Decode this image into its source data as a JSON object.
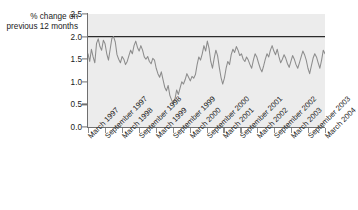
{
  "chart_data": {
    "type": "line",
    "title": "",
    "xlabel": "",
    "ylabel": "% change on previous 12 months",
    "ylim": [
      0.0,
      2.5
    ],
    "ytick_labels": [
      "2.5",
      "2.0",
      "1.5",
      "1.0",
      "0.5",
      "0.0"
    ],
    "ytick_values": [
      2.5,
      2.0,
      1.5,
      1.0,
      0.5,
      0.0
    ],
    "grid": false,
    "legend": "none",
    "plot_background": "#ececec",
    "line_color": "#8c8c8c",
    "reference_line": {
      "value": 2.0,
      "color": "#2b2b2b",
      "label": ""
    },
    "xtick_labels": [
      "March 1997",
      "September 1997",
      "March 1998",
      "September 1998",
      "March 1999",
      "September 1999",
      "March 2000",
      "September 2000",
      "March 2001",
      "September 2001",
      "March 2002",
      "September 2002",
      "March 2003",
      "September 2003",
      "March 2004"
    ],
    "x_start": "March 1997",
    "x_end": "March 2004",
    "x_interval": "monthly",
    "values": [
      1.62,
      1.45,
      1.72,
      1.55,
      1.42,
      1.85,
      1.95,
      1.78,
      1.7,
      1.92,
      1.84,
      1.62,
      1.48,
      1.72,
      1.96,
      2.0,
      1.88,
      1.6,
      1.5,
      1.42,
      1.56,
      1.5,
      1.38,
      1.45,
      1.58,
      1.7,
      1.62,
      1.8,
      1.9,
      1.76,
      1.68,
      1.8,
      1.7,
      1.55,
      1.5,
      1.56,
      1.45,
      1.4,
      1.52,
      1.48,
      1.3,
      1.18,
      1.1,
      1.22,
      1.05,
      0.88,
      0.8,
      0.92,
      0.7,
      0.6,
      0.52,
      0.62,
      0.82,
      0.72,
      0.86,
      1.0,
      0.95,
      1.05,
      1.18,
      1.1,
      1.02,
      1.12,
      1.08,
      1.16,
      1.38,
      1.55,
      1.48,
      1.62,
      1.8,
      1.68,
      1.9,
      1.74,
      1.45,
      1.3,
      1.52,
      1.7,
      1.58,
      1.32,
      1.1,
      0.95,
      1.08,
      1.3,
      1.45,
      1.38,
      1.6,
      1.72,
      1.65,
      1.78,
      1.7,
      1.58,
      1.62,
      1.5,
      1.45,
      1.55,
      1.48,
      1.38,
      1.3,
      1.48,
      1.62,
      1.55,
      1.42,
      1.3,
      1.22,
      1.35,
      1.5,
      1.62,
      1.55,
      1.7,
      1.8,
      1.68,
      1.6,
      1.72,
      1.55,
      1.42,
      1.5,
      1.6,
      1.52,
      1.4,
      1.32,
      1.45,
      1.58,
      1.5,
      1.38,
      1.3,
      1.42,
      1.55,
      1.68,
      1.6,
      1.48,
      1.3,
      1.18,
      1.35,
      1.52,
      1.62,
      1.55,
      1.42,
      1.3,
      1.48,
      1.7,
      1.62
    ]
  }
}
